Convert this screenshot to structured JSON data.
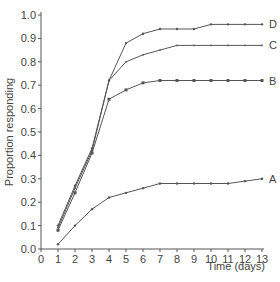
{
  "chart_data": {
    "type": "line",
    "title": "",
    "xlabel": "Time (days)",
    "ylabel": "Proportion responding",
    "xlim": [
      0,
      13
    ],
    "ylim": [
      0.0,
      1.0
    ],
    "x_ticks": [
      "0",
      "1",
      "2",
      "3",
      "4",
      "5",
      "6",
      "7",
      "8",
      "9",
      "10",
      "11",
      "12",
      "13"
    ],
    "y_ticks": [
      "0.0",
      "0.1",
      "0.2",
      "0.3",
      "0.4",
      "0.5",
      "0.6",
      "0.7",
      "0.8",
      "0.9",
      "1.0"
    ],
    "grid": false,
    "legend": "direct labels at line ends",
    "x": [
      1,
      2,
      3,
      4,
      5,
      6,
      7,
      8,
      9,
      10,
      11,
      12,
      13
    ],
    "series": [
      {
        "name": "D",
        "marker": "dot",
        "values": [
          0.1,
          0.27,
          0.43,
          0.72,
          0.88,
          0.92,
          0.94,
          0.94,
          0.94,
          0.96,
          0.96,
          0.96,
          0.96
        ]
      },
      {
        "name": "C",
        "marker": "tick",
        "values": [
          0.09,
          0.26,
          0.42,
          0.72,
          0.8,
          0.83,
          0.85,
          0.87,
          0.87,
          0.87,
          0.87,
          0.87,
          0.87
        ]
      },
      {
        "name": "B",
        "marker": "square",
        "values": [
          0.08,
          0.24,
          0.41,
          0.64,
          0.68,
          0.71,
          0.72,
          0.72,
          0.72,
          0.72,
          0.72,
          0.72,
          0.72
        ]
      },
      {
        "name": "A",
        "marker": "dot",
        "values": [
          0.02,
          0.1,
          0.17,
          0.22,
          0.24,
          0.26,
          0.28,
          0.28,
          0.28,
          0.28,
          0.28,
          0.29,
          0.3
        ]
      }
    ],
    "colors": {
      "line": "#555555",
      "axis": "#555555",
      "text": "#444444"
    }
  }
}
